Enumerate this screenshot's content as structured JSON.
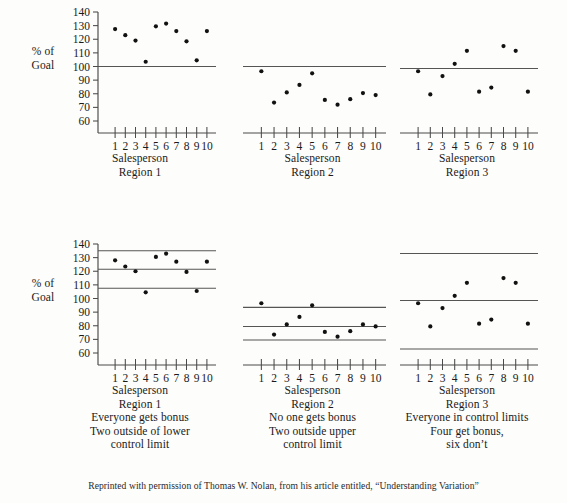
{
  "figure": {
    "ylabel_lines": [
      "%",
      "of",
      "Goal"
    ],
    "footer": "Reprinted with permission of Thomas W. Nolan, from his article entitled, “Understanding Variation”"
  },
  "chart_data": [
    {
      "id": "top-region-1",
      "type": "scatter",
      "title": "",
      "xlabel": "Salesperson",
      "ylabel": "% of Goal",
      "categories": [
        1,
        2,
        3,
        4,
        5,
        6,
        7,
        8,
        9,
        10
      ],
      "x": [
        1,
        2,
        3,
        4,
        5,
        6,
        7,
        8,
        9,
        10
      ],
      "values": [
        127.5,
        123,
        119,
        103.5,
        129.5,
        131.5,
        126,
        118.5,
        104.5,
        126
      ],
      "ylim": [
        60,
        140
      ],
      "yticks": [
        60,
        70,
        80,
        90,
        100,
        110,
        120,
        130,
        140
      ],
      "reference_lines": [
        {
          "name": "goal",
          "value": 100
        }
      ],
      "grid": false,
      "legend": "none",
      "caption_lines": [
        "Salesperson",
        "Region 1"
      ]
    },
    {
      "id": "top-region-2",
      "type": "scatter",
      "title": "",
      "xlabel": "Salesperson",
      "ylabel": "% of Goal",
      "categories": [
        1,
        2,
        3,
        4,
        5,
        6,
        7,
        8,
        9,
        10
      ],
      "x": [
        1,
        2,
        3,
        4,
        5,
        6,
        7,
        8,
        9,
        10
      ],
      "values": [
        96.5,
        73.5,
        81,
        86.5,
        95,
        75.5,
        72,
        76,
        80.5,
        79
      ],
      "ylim": [
        60,
        140
      ],
      "yticks": [
        60,
        70,
        80,
        90,
        100,
        110,
        120,
        130,
        140
      ],
      "reference_lines": [
        {
          "name": "goal",
          "value": 100
        }
      ],
      "grid": false,
      "legend": "none",
      "caption_lines": [
        "Salesperson",
        "Region 2"
      ]
    },
    {
      "id": "top-region-3",
      "type": "scatter",
      "title": "",
      "xlabel": "Salesperson",
      "ylabel": "% of Goal",
      "categories": [
        1,
        2,
        3,
        4,
        5,
        6,
        7,
        8,
        9,
        10
      ],
      "x": [
        1,
        2,
        3,
        4,
        5,
        6,
        7,
        8,
        9,
        10
      ],
      "values": [
        96.5,
        79.5,
        93,
        102,
        111.5,
        81.5,
        84.5,
        115,
        111.5,
        81.5
      ],
      "ylim": [
        60,
        140
      ],
      "yticks": [
        60,
        70,
        80,
        90,
        100,
        110,
        120,
        130,
        140
      ],
      "reference_lines": [
        {
          "name": "goal",
          "value": 98.5
        }
      ],
      "grid": false,
      "legend": "none",
      "caption_lines": [
        "Salesperson",
        "Region 3"
      ]
    },
    {
      "id": "bottom-region-1",
      "type": "scatter",
      "title": "",
      "xlabel": "Salesperson",
      "ylabel": "% of Goal",
      "categories": [
        1,
        2,
        3,
        4,
        5,
        6,
        7,
        8,
        9,
        10
      ],
      "x": [
        1,
        2,
        3,
        4,
        5,
        6,
        7,
        8,
        9,
        10
      ],
      "values": [
        128,
        123.5,
        120,
        104.5,
        130.5,
        133,
        127,
        119.5,
        105.5,
        127
      ],
      "ylim": [
        60,
        140
      ],
      "yticks": [
        60,
        70,
        80,
        90,
        100,
        110,
        120,
        130,
        140
      ],
      "reference_lines": [
        {
          "name": "upper-control-limit",
          "value": 135
        },
        {
          "name": "center-line",
          "value": 121.5
        },
        {
          "name": "lower-control-limit",
          "value": 107.5
        }
      ],
      "grid": false,
      "legend": "none",
      "caption_lines": [
        "Salesperson",
        "Region 1",
        "Everyone gets bonus",
        "Two outside of lower",
        "control limit"
      ]
    },
    {
      "id": "bottom-region-2",
      "type": "scatter",
      "title": "",
      "xlabel": "Salesperson",
      "ylabel": "% of Goal",
      "categories": [
        1,
        2,
        3,
        4,
        5,
        6,
        7,
        8,
        9,
        10
      ],
      "x": [
        1,
        2,
        3,
        4,
        5,
        6,
        7,
        8,
        9,
        10
      ],
      "values": [
        96.5,
        73.5,
        81,
        86.5,
        95,
        75.5,
        72,
        76,
        81,
        79.5
      ],
      "ylim": [
        60,
        140
      ],
      "yticks": [
        60,
        70,
        80,
        90,
        100,
        110,
        120,
        130,
        140
      ],
      "reference_lines": [
        {
          "name": "upper-control-limit",
          "value": 93.5
        },
        {
          "name": "center-line",
          "value": 79.5
        },
        {
          "name": "lower-control-limit",
          "value": 69.5
        }
      ],
      "grid": false,
      "legend": "none",
      "caption_lines": [
        "Salesperson",
        "Region 2",
        "No one gets bonus",
        "Two outside upper",
        "control limit"
      ]
    },
    {
      "id": "bottom-region-3",
      "type": "scatter",
      "title": "",
      "xlabel": "Salesperson",
      "ylabel": "% of Goal",
      "categories": [
        1,
        2,
        3,
        4,
        5,
        6,
        7,
        8,
        9,
        10
      ],
      "x": [
        1,
        2,
        3,
        4,
        5,
        6,
        7,
        8,
        9,
        10
      ],
      "values": [
        96.5,
        79.5,
        93,
        102,
        111.5,
        81.5,
        84.5,
        115,
        111.5,
        81.5
      ],
      "ylim": [
        60,
        140
      ],
      "yticks": [
        60,
        70,
        80,
        90,
        100,
        110,
        120,
        130,
        140
      ],
      "reference_lines": [
        {
          "name": "upper-control-limit",
          "value": 133
        },
        {
          "name": "center-line",
          "value": 98.5
        },
        {
          "name": "lower-control-limit",
          "value": 63
        }
      ],
      "grid": false,
      "legend": "none",
      "caption_lines": [
        "Salesperson",
        "Region 3",
        "Everyone in control limits",
        "Four get bonus,",
        "six don’t"
      ]
    }
  ]
}
